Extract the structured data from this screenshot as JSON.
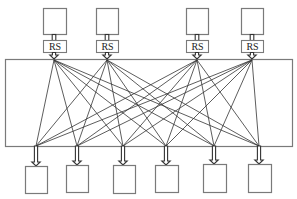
{
  "diagram": {
    "type": "interconnection-network",
    "colors": {
      "stroke": "#333333",
      "box_stroke": "#7a7a7a",
      "background": "#ffffff"
    },
    "top_units": [
      {
        "id": "src-1",
        "x": 43,
        "y": 8,
        "w": 23,
        "h": 26,
        "rs_label": "RS"
      },
      {
        "id": "src-2",
        "x": 96,
        "y": 8,
        "w": 22,
        "h": 26,
        "rs_label": "RS"
      },
      {
        "id": "src-3",
        "x": 186,
        "y": 8,
        "w": 22,
        "h": 26,
        "rs_label": "RS"
      },
      {
        "id": "src-4",
        "x": 241,
        "y": 8,
        "w": 22,
        "h": 26,
        "rs_label": "RS"
      }
    ],
    "rs_box": {
      "y": 40,
      "h": 12
    },
    "interconnect_region": {
      "x": 5,
      "y": 59,
      "w": 287,
      "h": 87
    },
    "top_ports_x": [
      54,
      107,
      197,
      252
    ],
    "top_port_y": 60,
    "bottom_ports_x": [
      36,
      77,
      123,
      166,
      214,
      259
    ],
    "bottom_port_y": 146,
    "bottom_units": [
      {
        "id": "dst-1",
        "x": 25,
        "y": 166,
        "w": 22,
        "h": 27
      },
      {
        "id": "dst-2",
        "x": 66,
        "y": 165,
        "w": 22,
        "h": 27
      },
      {
        "id": "dst-3",
        "x": 113,
        "y": 165,
        "w": 22,
        "h": 28
      },
      {
        "id": "dst-4",
        "x": 155,
        "y": 165,
        "w": 23,
        "h": 27
      },
      {
        "id": "dst-5",
        "x": 203,
        "y": 164,
        "w": 23,
        "h": 28
      },
      {
        "id": "dst-6",
        "x": 248,
        "y": 164,
        "w": 23,
        "h": 28
      }
    ],
    "connections": "all-to-all (4 x 6 = 24 links)"
  }
}
